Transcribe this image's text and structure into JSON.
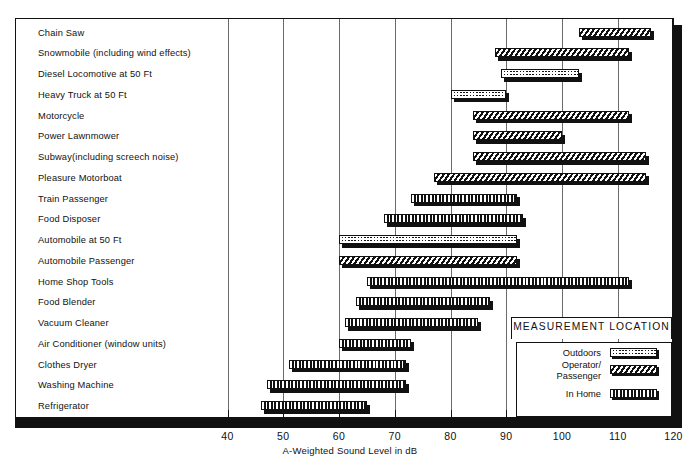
{
  "chart_data": {
    "type": "bar",
    "orientation": "horizontal-range",
    "title": "",
    "xlabel": "A-Weighted Sound Level in dB",
    "ylabel": "",
    "xlim": [
      35,
      120
    ],
    "xticks": [
      40,
      50,
      60,
      70,
      80,
      90,
      100,
      110,
      120
    ],
    "xtick_labels": [
      "40",
      "50",
      "60",
      "70",
      "80",
      "90",
      "100",
      "110",
      "120"
    ],
    "grid": true,
    "legend_position": "inside-bottom-right",
    "categories": [
      "Chain Saw",
      "Snowmobile (including wind effects)",
      "Diesel Locomotive at 50 Ft",
      "Heavy Truck at 50 Ft",
      "Motorcycle",
      "Power Lawnmower",
      "Subway(including screech noise)",
      "Pleasure Motorboat",
      "Train Passenger",
      "Food Disposer",
      "Automobile at 50 Ft",
      "Automobile Passenger",
      "Home Shop Tools",
      "Food Blender",
      "Vacuum Cleaner",
      "Air Conditioner (window units)",
      "Clothes Dryer",
      "Washing Machine",
      "Refrigerator"
    ],
    "series": [
      {
        "name": "Range (dB)",
        "ranges": [
          [
            103,
            116
          ],
          [
            88,
            112
          ],
          [
            89,
            103
          ],
          [
            80,
            90
          ],
          [
            84,
            112
          ],
          [
            84,
            100
          ],
          [
            84,
            115
          ],
          [
            77,
            115
          ],
          [
            73,
            92
          ],
          [
            68,
            93
          ],
          [
            60,
            92
          ],
          [
            60,
            92
          ],
          [
            65,
            112
          ],
          [
            63,
            87
          ],
          [
            61,
            85
          ],
          [
            60,
            73
          ],
          [
            51,
            72
          ],
          [
            47,
            72
          ],
          [
            46,
            65
          ]
        ],
        "patterns": [
          "operator",
          "operator",
          "outdoors",
          "outdoors",
          "operator",
          "operator",
          "operator",
          "operator",
          "inhome",
          "inhome",
          "outdoors",
          "operator",
          "inhome",
          "inhome",
          "inhome",
          "inhome",
          "inhome",
          "inhome",
          "inhome"
        ]
      }
    ]
  },
  "legend": {
    "title": "MEASUREMENT LOCATION",
    "entries": [
      {
        "label": "Outdoors",
        "key": "outdoors"
      },
      {
        "label": "Operator/\nPassenger",
        "key": "operator"
      },
      {
        "label": "In Home",
        "key": "inhome"
      }
    ]
  },
  "colors": {
    "ink": "#111111",
    "paper": "#ffffff",
    "grid": "#6b6b6b"
  }
}
